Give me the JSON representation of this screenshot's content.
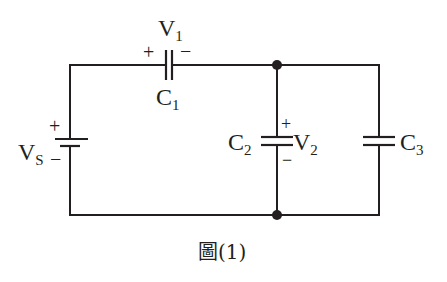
{
  "diagram": {
    "type": "circuit",
    "caption": {
      "text": "圖(1)"
    },
    "source": {
      "name": "V",
      "subscript": "S",
      "plus": "+",
      "minus": "−"
    },
    "components": [
      {
        "id": "C1",
        "name": "C",
        "subscript": "1",
        "voltage_name": "V",
        "voltage_subscript": "1",
        "plus": "+",
        "minus": "−",
        "orientation": "horizontal",
        "position": "top branch, series with source"
      },
      {
        "id": "C2",
        "name": "C",
        "subscript": "2",
        "voltage_name": "V",
        "voltage_subscript": "2",
        "plus": "+",
        "minus": "−",
        "orientation": "vertical",
        "position": "middle branch, parallel"
      },
      {
        "id": "C3",
        "name": "C",
        "subscript": "3",
        "orientation": "vertical",
        "position": "right branch, parallel with C2"
      }
    ],
    "junctions": [
      {
        "id": "top-node",
        "label": ""
      },
      {
        "id": "bottom-node",
        "label": ""
      }
    ],
    "colors": {
      "line": "#231f20",
      "background": "#ffffff"
    }
  }
}
